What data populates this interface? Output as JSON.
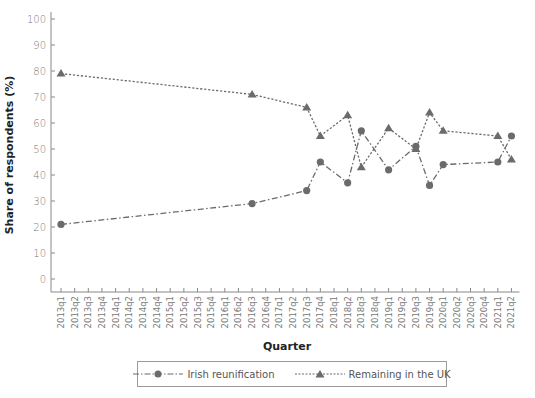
{
  "chart_data": {
    "type": "line",
    "title": "",
    "xlabel": "Quarter",
    "ylabel": "Share of respondents (%)",
    "ylim": [
      0,
      100
    ],
    "yticks": [
      0,
      10,
      20,
      30,
      40,
      50,
      60,
      70,
      80,
      90,
      100
    ],
    "grid": false,
    "legend_position": "bottom",
    "categories": [
      "2013q1",
      "2013q2",
      "2013q3",
      "2013q4",
      "2014q1",
      "2014q2",
      "2014q3",
      "2014q4",
      "2015q1",
      "2015q2",
      "2015q3",
      "2015q4",
      "2016q1",
      "2016q2",
      "2016q3",
      "2016q4",
      "2017q1",
      "2017q2",
      "2017q3",
      "2017q4",
      "2018q1",
      "2018q2",
      "2018q3",
      "2018q4",
      "2019q1",
      "2019q2",
      "2019q3",
      "2019q4",
      "2020q1",
      "2020q2",
      "2020q3",
      "2020q4",
      "2021q1",
      "2021q2"
    ],
    "series": [
      {
        "name": "Irish reunification",
        "marker": "circle",
        "line_style": "dash-dot",
        "color": "#6b6b6b",
        "points": [
          {
            "x": "2013q1",
            "y": 21
          },
          {
            "x": "2016q3",
            "y": 29
          },
          {
            "x": "2017q3",
            "y": 34
          },
          {
            "x": "2017q4",
            "y": 45
          },
          {
            "x": "2018q2",
            "y": 37
          },
          {
            "x": "2018q3",
            "y": 57
          },
          {
            "x": "2019q1",
            "y": 42
          },
          {
            "x": "2019q3",
            "y": 51
          },
          {
            "x": "2019q4",
            "y": 36
          },
          {
            "x": "2020q1",
            "y": 44
          },
          {
            "x": "2021q1",
            "y": 45
          },
          {
            "x": "2021q2",
            "y": 55
          }
        ]
      },
      {
        "name": "Remaining in the UK",
        "marker": "triangle",
        "line_style": "dotted",
        "color": "#6b6b6b",
        "points": [
          {
            "x": "2013q1",
            "y": 79
          },
          {
            "x": "2016q3",
            "y": 71
          },
          {
            "x": "2017q3",
            "y": 66
          },
          {
            "x": "2017q4",
            "y": 55
          },
          {
            "x": "2018q2",
            "y": 63
          },
          {
            "x": "2018q3",
            "y": 43
          },
          {
            "x": "2019q1",
            "y": 58
          },
          {
            "x": "2019q3",
            "y": 50
          },
          {
            "x": "2019q4",
            "y": 64
          },
          {
            "x": "2020q1",
            "y": 57
          },
          {
            "x": "2021q1",
            "y": 55
          },
          {
            "x": "2021q2",
            "y": 46
          }
        ]
      }
    ]
  },
  "legend": {
    "items": [
      {
        "label": "Irish reunification"
      },
      {
        "label": "Remaining in the UK"
      }
    ]
  }
}
